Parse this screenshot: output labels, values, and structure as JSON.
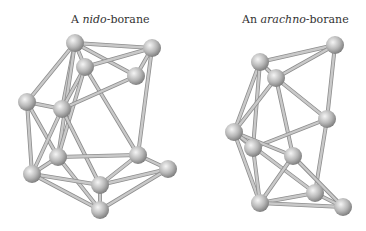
{
  "captions": {
    "left": {
      "prefix": "A ",
      "italic": "nido",
      "suffix": "-borane"
    },
    "right": {
      "prefix": "An ",
      "italic": "arachno",
      "suffix": "-borane"
    }
  },
  "colors": {
    "atom_light": "#f2f2f2",
    "atom_mid": "#b5b5b5",
    "atom_dark": "#7a7a7a",
    "bond": "#c9c9c9",
    "bond_edge": "#8e8e8e"
  },
  "molecules": {
    "nido": {
      "atoms": [
        [
          75,
          43
        ],
        [
          152,
          48
        ],
        [
          85,
          67
        ],
        [
          136,
          76
        ],
        [
          27,
          102
        ],
        [
          62,
          109
        ],
        [
          58,
          157
        ],
        [
          138,
          155
        ],
        [
          168,
          169
        ],
        [
          32,
          174
        ],
        [
          100,
          185
        ],
        [
          100,
          210
        ]
      ],
      "bonds": [
        [
          0,
          1
        ],
        [
          0,
          2
        ],
        [
          0,
          3
        ],
        [
          0,
          4
        ],
        [
          0,
          5
        ],
        [
          0,
          6
        ],
        [
          1,
          2
        ],
        [
          1,
          3
        ],
        [
          1,
          7
        ],
        [
          2,
          5
        ],
        [
          2,
          6
        ],
        [
          2,
          7
        ],
        [
          3,
          5
        ],
        [
          4,
          5
        ],
        [
          4,
          6
        ],
        [
          4,
          9
        ],
        [
          5,
          9
        ],
        [
          5,
          10
        ],
        [
          6,
          7
        ],
        [
          6,
          11
        ],
        [
          6,
          9
        ],
        [
          7,
          8
        ],
        [
          7,
          10
        ],
        [
          8,
          10
        ],
        [
          8,
          11
        ],
        [
          9,
          10
        ],
        [
          9,
          11
        ],
        [
          10,
          11
        ]
      ]
    },
    "arachno": {
      "atoms": [
        [
          335,
          45
        ],
        [
          260,
          62
        ],
        [
          276,
          78
        ],
        [
          327,
          119
        ],
        [
          234,
          132
        ],
        [
          253,
          148
        ],
        [
          293,
          156
        ],
        [
          260,
          203
        ],
        [
          315,
          193
        ],
        [
          343,
          207
        ]
      ],
      "bonds": [
        [
          0,
          1
        ],
        [
          0,
          2
        ],
        [
          0,
          3
        ],
        [
          1,
          2
        ],
        [
          1,
          4
        ],
        [
          1,
          5
        ],
        [
          2,
          3
        ],
        [
          2,
          4
        ],
        [
          2,
          6
        ],
        [
          3,
          5
        ],
        [
          3,
          8
        ],
        [
          4,
          5
        ],
        [
          4,
          6
        ],
        [
          4,
          7
        ],
        [
          4,
          8
        ],
        [
          5,
          7
        ],
        [
          6,
          7
        ],
        [
          6,
          9
        ],
        [
          7,
          8
        ],
        [
          7,
          9
        ],
        [
          8,
          9
        ]
      ]
    }
  }
}
